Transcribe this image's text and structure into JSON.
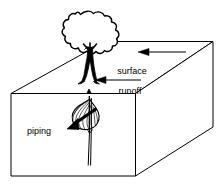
{
  "figure": {
    "type": "block-diagram",
    "stroke_color": "#000000",
    "fill_color": "#ffffff",
    "background": "#ffffff"
  },
  "labels": {
    "surface_runoff": {
      "line1": "surface",
      "line2": "runoff"
    },
    "piping": "piping"
  },
  "elements": {
    "block": "soil-block",
    "tree": "tree",
    "tree_roots": "tree-roots",
    "pipe_cavity": "piping-cavity",
    "pipe_channel": "piping-channel",
    "arrow_runoff_upper": "runoff-arrow-upper",
    "arrow_runoff_lower": "runoff-arrow-lower",
    "arrow_piping": "piping-arrow"
  }
}
